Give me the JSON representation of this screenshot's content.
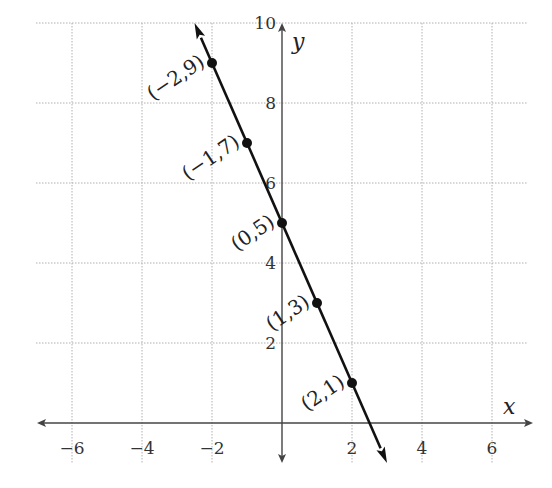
{
  "chart_data": {
    "type": "line",
    "title": "",
    "xlabel": "x",
    "ylabel": "y",
    "xlim": [
      -7,
      7
    ],
    "ylim": [
      -1,
      10
    ],
    "grid": true,
    "x_ticks": [
      -6,
      -4,
      -2,
      2,
      4,
      6
    ],
    "y_ticks": [
      2,
      4,
      6,
      8,
      10
    ],
    "x_tick_labels": [
      "−6",
      "−4",
      "−2",
      "2",
      "4",
      "6"
    ],
    "y_tick_labels": [
      "2",
      "4",
      "6",
      "8",
      "10"
    ],
    "series": [
      {
        "name": "y = -2x + 5",
        "line_extent": {
          "from": [
            -2.5,
            10
          ],
          "to": [
            3,
            -1
          ]
        },
        "arrows_both_ends": true,
        "points": [
          {
            "x": -2,
            "y": 9,
            "label": "(−2,9)"
          },
          {
            "x": -1,
            "y": 7,
            "label": "(−1,7)"
          },
          {
            "x": 0,
            "y": 5,
            "label": "(0,5)"
          },
          {
            "x": 1,
            "y": 3,
            "label": "(1,3)"
          },
          {
            "x": 2,
            "y": 1,
            "label": "(2,1)"
          }
        ]
      }
    ],
    "colors": {
      "line": "#111111",
      "axis": "#444444",
      "grid": "#b0b0b0",
      "text": "#222222"
    }
  }
}
